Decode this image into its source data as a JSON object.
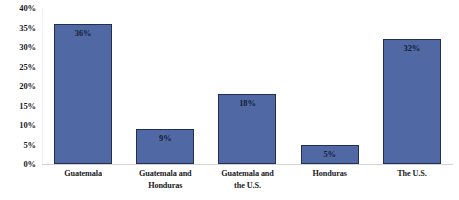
{
  "chart_data": {
    "type": "bar",
    "title": "",
    "subtitle": "",
    "xlabel": "",
    "ylabel": "",
    "categories": [
      "Guatemala",
      "Guatemala and Honduras",
      "Guatemala and the U.S.",
      "Honduras",
      "The U.S."
    ],
    "category_lines": [
      [
        "Guatemala"
      ],
      [
        "Guatemala and",
        "Honduras"
      ],
      [
        "Guatemala and",
        "the U.S."
      ],
      [
        "Honduras"
      ],
      [
        "The U.S."
      ]
    ],
    "values": [
      36,
      9,
      18,
      5,
      32
    ],
    "value_labels": [
      "36%",
      "9%",
      "18%",
      "5%",
      "32%"
    ],
    "ylim": [
      0,
      40
    ],
    "ytick_values": [
      0,
      5,
      10,
      15,
      20,
      25,
      30,
      35,
      40
    ],
    "ytick_labels": [
      "0%",
      "5%",
      "10%",
      "15%",
      "20%",
      "25%",
      "30%",
      "35%",
      "40%"
    ],
    "grid": false,
    "legend": false,
    "legend_position": "none",
    "units": "percent",
    "colors": {
      "bar_fill": "#5069a4",
      "bar_border": "#232f52",
      "value_label": "#141d38",
      "axis_label": "#1a1a1a",
      "baseline": "#d4d4d4",
      "axis_line": "#eef2f7",
      "background": "#ffffff"
    }
  }
}
